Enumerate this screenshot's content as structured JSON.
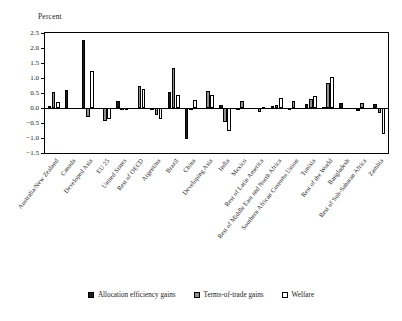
{
  "chart_data": {
    "type": "bar",
    "title": "",
    "ylabel": "Percent",
    "xlabel": "",
    "ylim": [
      -1.5,
      2.5
    ],
    "ytick_step": 0.5,
    "yticks": [
      "2.5",
      "2.0",
      "1.5",
      "1.0",
      "0.5",
      "0.0",
      "-0.5",
      "-1.0",
      "-1.5"
    ],
    "grid": false,
    "legend_position": "bottom",
    "categories": [
      "Australia/New Zealand",
      "Canada",
      "Developed Asia",
      "EU 25",
      "United States",
      "Rest of OECD",
      "Argentina",
      "Brazil",
      "China",
      "Developing Asia",
      "India",
      "Mexico",
      "Rest of Latin America",
      "Rest of Middle East and North Africa",
      "Southern African Customs Union",
      "Tunisia",
      "Rest of the World",
      "Bangladesh",
      "Rest of Sub-Saharan Africa",
      "Zambia"
    ],
    "series": [
      {
        "name": "Allocation efficiency gains",
        "color": "#1c1c1c",
        "values": [
          0.08,
          0.6,
          2.26,
          0.0,
          0.22,
          0.0,
          -0.04,
          0.55,
          -1.03,
          0.0,
          0.1,
          -0.08,
          0.0,
          0.08,
          -0.08,
          0.12,
          0.05,
          0.16,
          -0.1,
          0.12
        ]
      },
      {
        "name": "Terms-of-trade gains",
        "color": "#8f8f8f",
        "values": [
          0.55,
          0.0,
          -0.3,
          -0.42,
          -0.05,
          0.72,
          -0.22,
          1.35,
          -0.02,
          0.58,
          -0.48,
          0.22,
          -0.14,
          0.1,
          0.22,
          0.3,
          0.82,
          0.0,
          0.16,
          -0.16
        ]
      },
      {
        "name": "Welfare",
        "color": "#ffffff",
        "values": [
          0.2,
          0.0,
          1.22,
          -0.35,
          -0.03,
          0.64,
          -0.38,
          0.45,
          0.28,
          0.42,
          -0.75,
          0.0,
          0.05,
          0.34,
          0.0,
          0.4,
          1.02,
          0.0,
          0.0,
          -0.86
        ]
      }
    ]
  },
  "legend": {
    "items": [
      {
        "label": "Allocation efficiency gains",
        "key": "alloc"
      },
      {
        "label": "Terms-of-trade gains",
        "key": "tot"
      },
      {
        "label": "Welfare",
        "key": "wel"
      }
    ]
  }
}
